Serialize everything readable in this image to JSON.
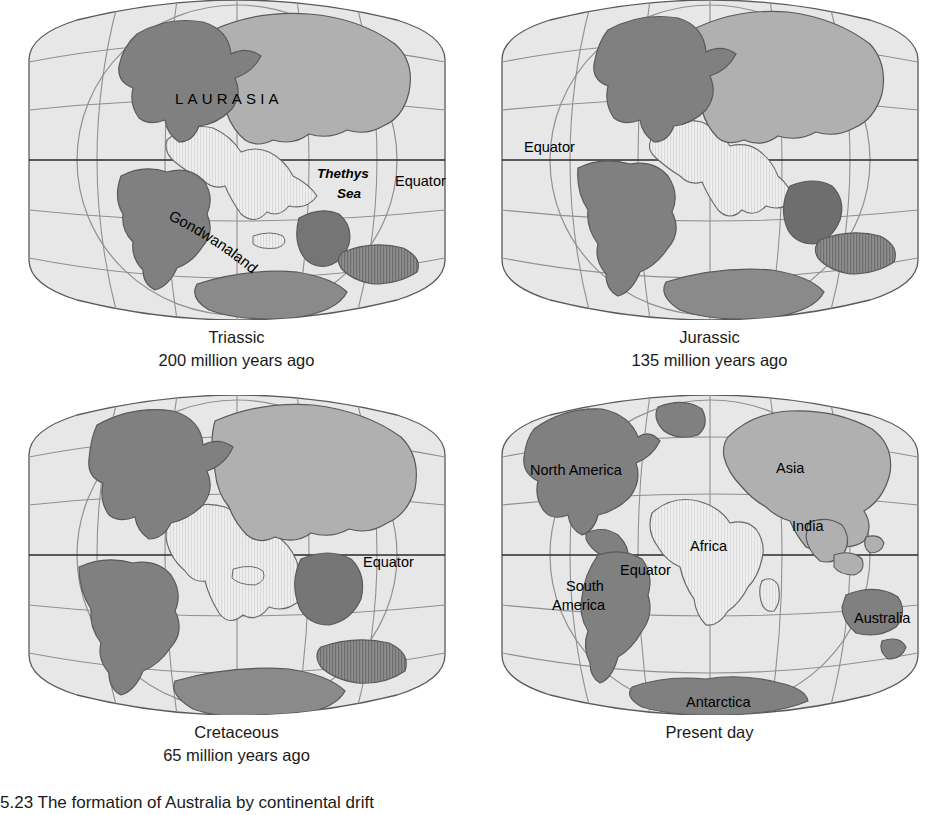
{
  "figure": {
    "caption": "5.23  The formation of Australia by continental drift",
    "colors": {
      "ocean": "#e7e7e7",
      "land_dark": "#808080",
      "land_mid": "#b0b0b0",
      "land_striped": "#efefef",
      "graticule": "#909090",
      "outline": "#5a5a5a",
      "equator_line": "#2a2a2a",
      "text": "#1a1a1a",
      "background": "#ffffff"
    }
  },
  "panels": [
    {
      "id": "triassic",
      "title": "Triassic",
      "subtitle": "200 million years ago",
      "labels": [
        {
          "name": "laurasia",
          "text": "LAURASIA",
          "style": "wide",
          "x": 238,
          "y": 100
        },
        {
          "name": "thethys-sea-line1",
          "text": "Thethys",
          "style": "italic",
          "x": 318,
          "y": 178
        },
        {
          "name": "thethys-sea-line2",
          "text": "Sea",
          "style": "italic",
          "x": 336,
          "y": 197
        },
        {
          "name": "equator",
          "text": "Equator",
          "style": "plain",
          "x": 396,
          "y": 188
        },
        {
          "name": "gondwanaland",
          "text": "Gondwanaland",
          "style": "curved",
          "x": 0,
          "y": 0
        }
      ]
    },
    {
      "id": "jurassic",
      "title": "Jurassic",
      "subtitle": "135 million years ago",
      "labels": [
        {
          "name": "equator",
          "text": "Equator",
          "style": "plain",
          "x": 40,
          "y": 152
        }
      ]
    },
    {
      "id": "cretaceous",
      "title": "Cretaceous",
      "subtitle": "65 million years ago",
      "labels": [
        {
          "name": "equator",
          "text": "Equator",
          "style": "plain",
          "x": 352,
          "y": 178
        }
      ]
    },
    {
      "id": "present-day",
      "title": "Present day",
      "subtitle": "",
      "labels": [
        {
          "name": "north-america",
          "text": "North America",
          "style": "plain",
          "x": 48,
          "y": 77
        },
        {
          "name": "asia",
          "text": "Asia",
          "style": "plain",
          "x": 288,
          "y": 76
        },
        {
          "name": "india",
          "text": "India",
          "style": "plain",
          "x": 305,
          "y": 134
        },
        {
          "name": "africa",
          "text": "Africa",
          "style": "plain",
          "x": 204,
          "y": 155
        },
        {
          "name": "equator",
          "text": "Equator",
          "style": "plain",
          "x": 132,
          "y": 180
        },
        {
          "name": "south-america-line1",
          "text": "South",
          "style": "plain",
          "x": 78,
          "y": 195
        },
        {
          "name": "south-america-line2",
          "text": "America",
          "style": "plain",
          "x": 65,
          "y": 215
        },
        {
          "name": "australia",
          "text": "Australia",
          "style": "plain",
          "x": 368,
          "y": 226
        },
        {
          "name": "antarctica",
          "text": "Antarctica",
          "style": "plain",
          "x": 200,
          "y": 312
        }
      ]
    }
  ]
}
